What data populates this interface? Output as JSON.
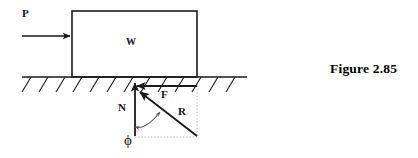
{
  "figure": {
    "caption": "Figure 2.85",
    "labels": {
      "applied_force": "P",
      "block_weight": "W",
      "normal_force": "N",
      "friction_force": "F",
      "resultant_force": "R",
      "angle": "ϕ"
    },
    "colors": {
      "stroke": "#1a1a1a",
      "background": "#ffffff",
      "guide": "#b9b9b9"
    },
    "geometry": {
      "block": {
        "x": 72,
        "y": 11,
        "width": 125,
        "height": 66
      },
      "ground_line": {
        "x1": 22,
        "y1": 77,
        "x2": 247,
        "y2": 77
      },
      "p_arrow": {
        "x1": 22,
        "y1": 36,
        "x2": 71,
        "y2": 36
      },
      "n_arrow": {
        "x1": 135,
        "y1": 136,
        "x2": 135,
        "y2": 84
      },
      "f_arrow": {
        "x1": 197,
        "y1": 86,
        "x2": 136,
        "y2": 86
      },
      "r_arrow": {
        "x1": 197,
        "y1": 136,
        "x2": 139,
        "y2": 91
      },
      "guide_vertical": {
        "x1": 197,
        "y1": 86,
        "x2": 197,
        "y2": 137
      },
      "guide_horizontal": {
        "x1": 136,
        "y1": 137,
        "x2": 197,
        "y2": 137
      },
      "hatch_count": 13
    }
  }
}
